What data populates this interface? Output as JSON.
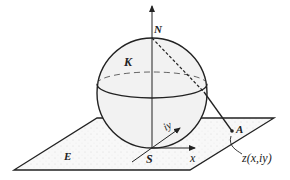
{
  "diagram": {
    "labels": {
      "north": "N",
      "sphere": "K",
      "plane": "E",
      "south": "S",
      "point": "A",
      "x_axis": "x",
      "y_axis": "iy",
      "point_coord": "z(x,iy)"
    },
    "colors": {
      "stroke": "#222222",
      "sphere_fill": "#f1f1f1",
      "plane_fill": "#f7f7f7",
      "background": "#ffffff"
    }
  }
}
